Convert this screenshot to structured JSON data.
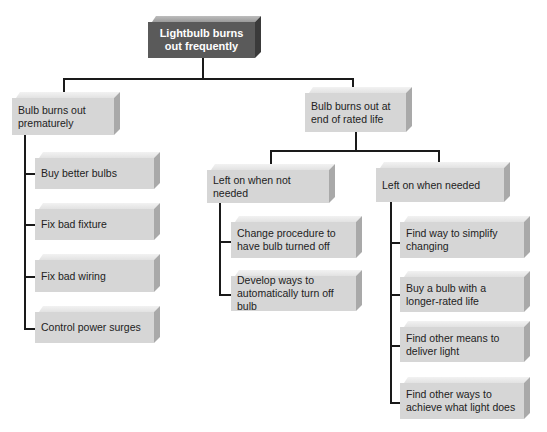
{
  "diagram": {
    "type": "tree",
    "root": {
      "label": "Lightbulb burns out frequently"
    },
    "branches": [
      {
        "label": "Bulb burns out prematurely",
        "children": [
          {
            "label": "Buy better bulbs"
          },
          {
            "label": "Fix bad fixture"
          },
          {
            "label": "Fix bad wiring"
          },
          {
            "label": "Control power surges"
          }
        ]
      },
      {
        "label": "Bulb burns out at end of rated life",
        "children": [
          {
            "label": "Left on when not needed",
            "children": [
              {
                "label": "Change procedure to have bulb turned off"
              },
              {
                "label": "Develop ways to automatically turn off bulb"
              }
            ]
          },
          {
            "label": "Left on when needed",
            "children": [
              {
                "label": "Find way to simplify changing"
              },
              {
                "label": "Buy a bulb with a longer-rated life"
              },
              {
                "label": "Find other means to deliver light"
              },
              {
                "label": "Find other ways to achieve what light does"
              }
            ]
          }
        ]
      }
    ]
  },
  "colors": {
    "root_box": "#5a5a5a",
    "node_box": "#d6d6d6",
    "connector": "#1a1a1a"
  }
}
